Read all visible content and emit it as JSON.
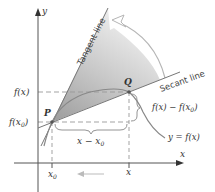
{
  "diagram": {
    "axes": {
      "x_label": "x",
      "y_label": "y"
    },
    "points": {
      "p_label": "P",
      "q_label": "Q"
    },
    "lines": {
      "tangent_label": "Tangent line",
      "secant_label": "Secant line",
      "curve_label": "y = f(x)"
    },
    "y_ticks": {
      "fx_label": "f(x)",
      "fx0_label": "f(x",
      "fx0_sub": "0",
      "fx0_close": ")"
    },
    "x_ticks": {
      "x0_label": "x",
      "x0_sub": "0",
      "x_label": "x"
    },
    "braces": {
      "horizontal_label": "x − x",
      "horizontal_sub": "0",
      "vertical_label": "f(x) − f(x",
      "vertical_sub": "0",
      "vertical_close": ")"
    },
    "colors": {
      "axis": "#555555",
      "curve": "#888888",
      "shade_dark": "#a8a8a8",
      "shade_light": "#f2f2f2",
      "dashed": "#999999",
      "arrow_outline": "#b0b0b0"
    }
  }
}
